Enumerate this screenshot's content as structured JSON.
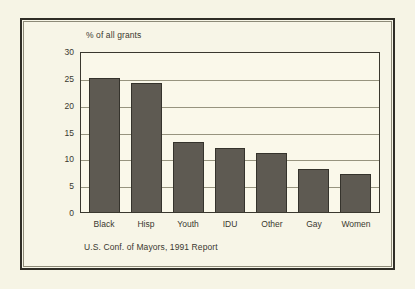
{
  "figure": {
    "source_caption": "U.S. Conf. of Mayors, 1991 Report",
    "background_color": "#f6f4e5",
    "frame_color": "#2f2d26"
  },
  "chart_data": {
    "type": "bar",
    "title": "",
    "subtitle": "",
    "xlabel": "",
    "ylabel": "% of all grants",
    "categories": [
      "Black",
      "Hisp",
      "Youth",
      "IDU",
      "Other",
      "Gay",
      "Women"
    ],
    "values": [
      25,
      24,
      13,
      12,
      11,
      8,
      7
    ],
    "ylim": [
      0,
      30
    ],
    "ytick_labels": [
      "30",
      "25",
      "20",
      "15",
      "10",
      "5",
      "0"
    ],
    "ytick_values": [
      30,
      25,
      20,
      15,
      10,
      5,
      0
    ],
    "grid": true,
    "grid_orientation": "horizontal",
    "legend": false,
    "legend_position": "none",
    "bar_color": "#5e5a52",
    "bar_edge_color": "#35332c",
    "plot_background": "#faf8ea",
    "annotations": []
  }
}
